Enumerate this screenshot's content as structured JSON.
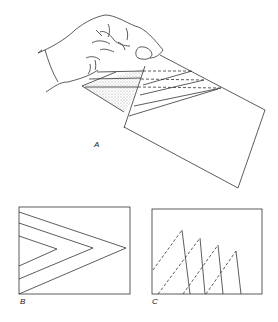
{
  "figure": {
    "panels": [
      {
        "id": "A",
        "label": "A",
        "description": "Hand holding folded paper with shaded triangle and parallel crease lines"
      },
      {
        "id": "B",
        "label": "B",
        "description": "Rectangle with three nested chevron lines pointing right"
      },
      {
        "id": "C",
        "label": "C",
        "description": "Rectangle with four sawtooth peaks of solid and dashed lines"
      }
    ]
  },
  "colors": {
    "line": "#333333",
    "shade": "#cfcfcf",
    "background": "#ffffff"
  }
}
